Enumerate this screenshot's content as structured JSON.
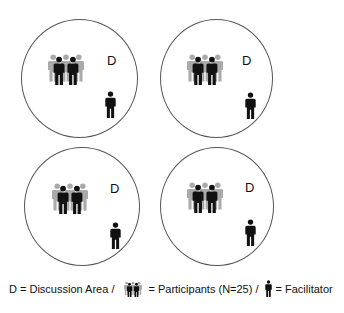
{
  "diagram": {
    "areas": [
      {
        "id": "area-1",
        "label": "D"
      },
      {
        "id": "area-2",
        "label": "D"
      },
      {
        "id": "area-3",
        "label": "D"
      },
      {
        "id": "area-4",
        "label": "D"
      }
    ],
    "colors": {
      "participant": "#111111",
      "participant_back": "#aaaaaa",
      "facilitator": "#111111",
      "circle": "#555555"
    }
  },
  "legend": {
    "discussion": "D = Discussion Area /",
    "participants": "= Participants (N=25) /",
    "facilitator": "= Facilitator"
  }
}
